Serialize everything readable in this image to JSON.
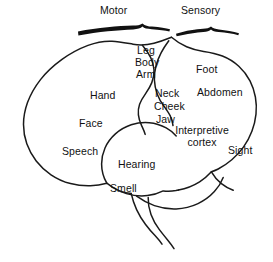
{
  "figure": {
    "background_color": "#ffffff",
    "ink_color": "#111111"
  },
  "braces": {
    "motor": {
      "label": "Motor",
      "name": "motor-brace"
    },
    "sensory": {
      "label": "Sensory",
      "name": "sensory-brace"
    }
  },
  "labels": {
    "motor": "Motor",
    "sensory": "Sensory",
    "leg": "Leg",
    "body": "Body",
    "arm": "Arm",
    "foot": "Foot",
    "abdomen": "Abdomen",
    "hand": "Hand",
    "neck": "Neck",
    "cheek": "Cheek",
    "jaw": "Jaw",
    "face": "Face",
    "interpretive_cortex": "Interpretive cortex",
    "speech": "Speech",
    "sight": "Sight",
    "hearing": "Hearing",
    "smell": "Smell"
  },
  "regions": [
    {
      "key": "motor",
      "label": "Motor",
      "group": "header-brace"
    },
    {
      "key": "sensory",
      "label": "Sensory",
      "group": "header-brace"
    },
    {
      "key": "leg",
      "label": "Leg",
      "group": "motor-strip"
    },
    {
      "key": "body",
      "label": "Body",
      "group": "motor-strip"
    },
    {
      "key": "arm",
      "label": "Arm",
      "group": "motor-strip"
    },
    {
      "key": "hand",
      "label": "Hand",
      "group": "motor-strip"
    },
    {
      "key": "face",
      "label": "Face",
      "group": "motor-strip"
    },
    {
      "key": "speech",
      "label": "Speech",
      "group": "frontal-lobe"
    },
    {
      "key": "neck",
      "label": "Neck",
      "group": "sensory-strip"
    },
    {
      "key": "cheek",
      "label": "Cheek",
      "group": "sensory-strip"
    },
    {
      "key": "jaw",
      "label": "Jaw",
      "group": "sensory-strip"
    },
    {
      "key": "foot",
      "label": "Foot",
      "group": "sensory-strip"
    },
    {
      "key": "abdomen",
      "label": "Abdomen",
      "group": "sensory-strip"
    },
    {
      "key": "interpretive_cortex",
      "label": "Interpretive cortex",
      "group": "parietal-temporal"
    },
    {
      "key": "sight",
      "label": "Sight",
      "group": "occipital-lobe"
    },
    {
      "key": "hearing",
      "label": "Hearing",
      "group": "temporal-lobe"
    },
    {
      "key": "smell",
      "label": "Smell",
      "group": "temporal-lobe"
    }
  ]
}
